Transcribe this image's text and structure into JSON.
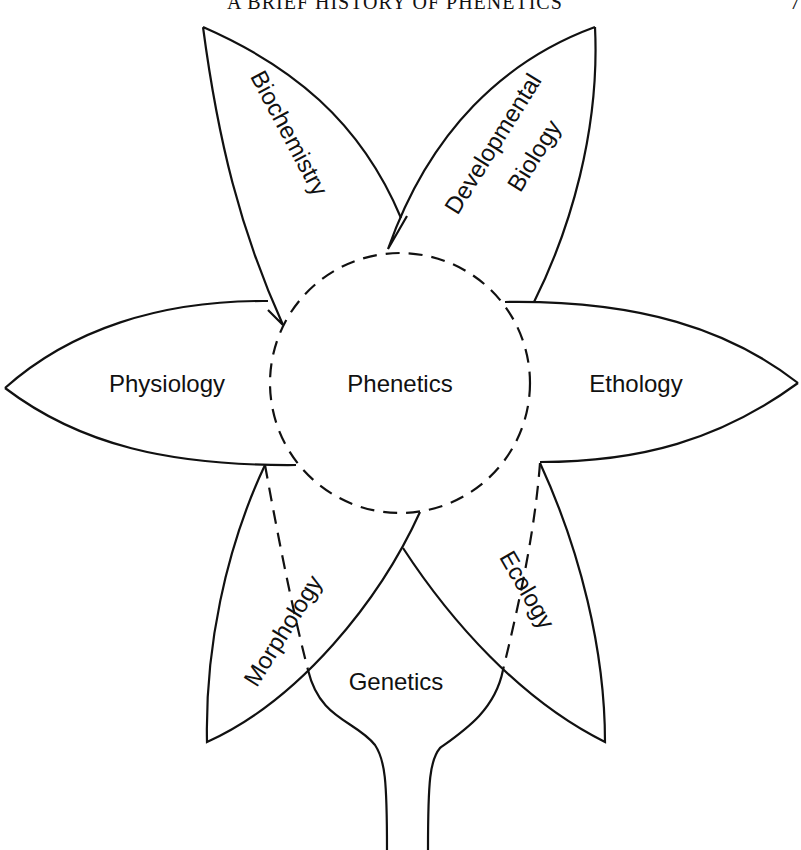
{
  "header": {
    "running_title": "A BRIEF HISTORY OF PHENETICS",
    "page_number": "7"
  },
  "figure": {
    "type": "flower diagram",
    "center": {
      "label": "Phenetics",
      "style": "dashed circle"
    },
    "petals": [
      {
        "id": "biochemistry",
        "label": "Biochemistry",
        "position": "upper-left"
      },
      {
        "id": "developmental-biology",
        "label_line1": "Developmental",
        "label_line2": "Biology",
        "position": "upper-right"
      },
      {
        "id": "physiology",
        "label": "Physiology",
        "position": "left"
      },
      {
        "id": "ethology",
        "label": "Ethology",
        "position": "right"
      },
      {
        "id": "morphology",
        "label": "Morphology",
        "position": "lower-left"
      },
      {
        "id": "ecology",
        "label": "Ecology",
        "position": "lower-right"
      },
      {
        "id": "genetics",
        "label": "Genetics",
        "position": "bottom (bulb with stem)"
      }
    ],
    "colors": {
      "stroke": "#111111",
      "background": "#ffffff"
    }
  }
}
